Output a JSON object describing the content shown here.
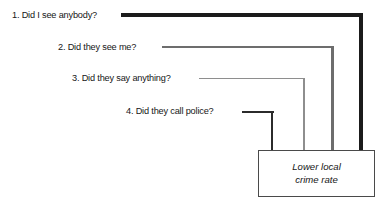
{
  "diagram": {
    "type": "flow-convergence",
    "questions": [
      {
        "id": 1,
        "label": "1. Did I see anybody?"
      },
      {
        "id": 2,
        "label": "2. Did they see me?"
      },
      {
        "id": 3,
        "label": "3. Did they say anything?"
      },
      {
        "id": 4,
        "label": "4. Did they call police?"
      }
    ],
    "outcome": {
      "line1": "Lower local",
      "line2": "crime rate"
    },
    "colors": {
      "background": "#ffffff",
      "text": "#161616",
      "connector_1": "#1b1b1b",
      "connector_2": "#6d6d6d",
      "connector_3": "#8e8e8e",
      "connector_4": "#2b2b2b",
      "box_border": "#4a4a4a"
    }
  }
}
